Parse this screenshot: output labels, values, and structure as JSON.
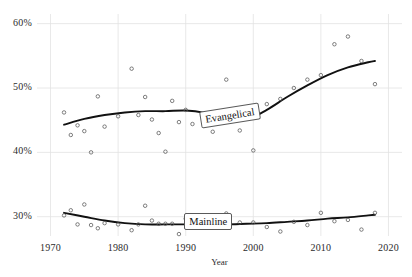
{
  "chart_data": {
    "type": "scatter",
    "title": "",
    "xlabel": "Year",
    "ylabel": "",
    "xlim": [
      1968,
      2022
    ],
    "ylim": [
      27.0,
      61.5
    ],
    "grid": true,
    "legend_position": "inline-annotation",
    "xticks": [
      1970,
      1980,
      1990,
      2000,
      2010,
      2020
    ],
    "xtick_labels": [
      "1970",
      "1980",
      "1990",
      "2000",
      "2010",
      "2020"
    ],
    "yticks": [
      30,
      40,
      50,
      60
    ],
    "ytick_labels": [
      "30%",
      "40%",
      "50%",
      "60%"
    ],
    "annotations": [
      {
        "text": "Evangelical",
        "x": 1996.5,
        "y": 45.6,
        "rotation": -9
      },
      {
        "text": "Mainline",
        "x": 1993.5,
        "y": 29.1,
        "rotation": 0
      }
    ],
    "series": [
      {
        "name": "Evangelical",
        "marker": "open-circle",
        "color": "#444444",
        "points": [
          {
            "x": 1972,
            "y": 46.2
          },
          {
            "x": 1973,
            "y": 42.7
          },
          {
            "x": 1974,
            "y": 44.2
          },
          {
            "x": 1975,
            "y": 43.3
          },
          {
            "x": 1976,
            "y": 40.0
          },
          {
            "x": 1977,
            "y": 48.7
          },
          {
            "x": 1978,
            "y": 44.0
          },
          {
            "x": 1980,
            "y": 45.6
          },
          {
            "x": 1982,
            "y": 53.0
          },
          {
            "x": 1983,
            "y": 45.8
          },
          {
            "x": 1984,
            "y": 48.6
          },
          {
            "x": 1985,
            "y": 45.1
          },
          {
            "x": 1986,
            "y": 43.0
          },
          {
            "x": 1987,
            "y": 40.1
          },
          {
            "x": 1988,
            "y": 48.0
          },
          {
            "x": 1989,
            "y": 44.7
          },
          {
            "x": 1990,
            "y": 46.6
          },
          {
            "x": 1991,
            "y": 44.4
          },
          {
            "x": 1993,
            "y": 46.0
          },
          {
            "x": 1994,
            "y": 43.2
          },
          {
            "x": 1996,
            "y": 51.3
          },
          {
            "x": 1998,
            "y": 43.4
          },
          {
            "x": 2000,
            "y": 40.3
          },
          {
            "x": 2002,
            "y": 47.5
          },
          {
            "x": 2004,
            "y": 48.3
          },
          {
            "x": 2006,
            "y": 50.0
          },
          {
            "x": 2008,
            "y": 51.3
          },
          {
            "x": 2010,
            "y": 52.0
          },
          {
            "x": 2012,
            "y": 56.8
          },
          {
            "x": 2014,
            "y": 58.0
          },
          {
            "x": 2016,
            "y": 54.2
          },
          {
            "x": 2018,
            "y": 50.6
          }
        ],
        "trend": [
          {
            "x": 1972,
            "y": 44.3
          },
          {
            "x": 1975,
            "y": 45.2
          },
          {
            "x": 1978,
            "y": 45.8
          },
          {
            "x": 1981,
            "y": 46.2
          },
          {
            "x": 1984,
            "y": 46.4
          },
          {
            "x": 1987,
            "y": 46.4
          },
          {
            "x": 1990,
            "y": 46.5
          },
          {
            "x": 1993,
            "y": 46.1
          },
          {
            "x": 1996,
            "y": 45.3
          },
          {
            "x": 1999,
            "y": 45.1
          },
          {
            "x": 2002,
            "y": 46.6
          },
          {
            "x": 2005,
            "y": 48.6
          },
          {
            "x": 2008,
            "y": 50.4
          },
          {
            "x": 2011,
            "y": 52.0
          },
          {
            "x": 2014,
            "y": 53.2
          },
          {
            "x": 2017,
            "y": 54.0
          },
          {
            "x": 2018,
            "y": 54.2
          }
        ]
      },
      {
        "name": "Mainline",
        "marker": "open-circle",
        "color": "#444444",
        "points": [
          {
            "x": 1972,
            "y": 30.2
          },
          {
            "x": 1973,
            "y": 31.0
          },
          {
            "x": 1974,
            "y": 28.8
          },
          {
            "x": 1975,
            "y": 31.9
          },
          {
            "x": 1976,
            "y": 28.7
          },
          {
            "x": 1977,
            "y": 28.2
          },
          {
            "x": 1978,
            "y": 29.0
          },
          {
            "x": 1980,
            "y": 28.8
          },
          {
            "x": 1982,
            "y": 27.9
          },
          {
            "x": 1983,
            "y": 28.8
          },
          {
            "x": 1984,
            "y": 31.7
          },
          {
            "x": 1985,
            "y": 29.4
          },
          {
            "x": 1986,
            "y": 28.9
          },
          {
            "x": 1987,
            "y": 28.9
          },
          {
            "x": 1988,
            "y": 28.9
          },
          {
            "x": 1989,
            "y": 27.3
          },
          {
            "x": 1990,
            "y": 29.7
          },
          {
            "x": 1991,
            "y": 30.2
          },
          {
            "x": 1993,
            "y": 28.8
          },
          {
            "x": 1994,
            "y": 28.6
          },
          {
            "x": 1996,
            "y": 30.5
          },
          {
            "x": 1998,
            "y": 29.1
          },
          {
            "x": 2000,
            "y": 29.1
          },
          {
            "x": 2002,
            "y": 28.4
          },
          {
            "x": 2004,
            "y": 27.7
          },
          {
            "x": 2006,
            "y": 29.2
          },
          {
            "x": 2008,
            "y": 28.7
          },
          {
            "x": 2010,
            "y": 30.6
          },
          {
            "x": 2012,
            "y": 29.3
          },
          {
            "x": 2014,
            "y": 29.5
          },
          {
            "x": 2016,
            "y": 28.0
          },
          {
            "x": 2018,
            "y": 30.6
          }
        ],
        "trend": [
          {
            "x": 1972,
            "y": 30.6
          },
          {
            "x": 1975,
            "y": 30.0
          },
          {
            "x": 1978,
            "y": 29.4
          },
          {
            "x": 1981,
            "y": 29.0
          },
          {
            "x": 1984,
            "y": 28.8
          },
          {
            "x": 1987,
            "y": 28.8
          },
          {
            "x": 1990,
            "y": 28.8
          },
          {
            "x": 1993,
            "y": 28.8
          },
          {
            "x": 1996,
            "y": 28.8
          },
          {
            "x": 1999,
            "y": 28.9
          },
          {
            "x": 2002,
            "y": 29.0
          },
          {
            "x": 2005,
            "y": 29.2
          },
          {
            "x": 2008,
            "y": 29.4
          },
          {
            "x": 2011,
            "y": 29.7
          },
          {
            "x": 2014,
            "y": 29.9
          },
          {
            "x": 2017,
            "y": 30.2
          },
          {
            "x": 2018,
            "y": 30.3
          }
        ]
      }
    ]
  },
  "style": {
    "grid_color": "#e2e2e2",
    "line_color": "#111111",
    "marker_edge": "#555555",
    "text_color": "#2b2b2b",
    "background": "#ffffff"
  }
}
